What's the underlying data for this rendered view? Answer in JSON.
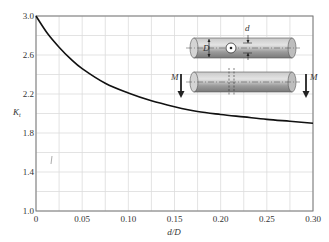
{
  "chart_data": {
    "type": "line",
    "title": "",
    "xlabel": "d/D",
    "ylabel": "Kt",
    "xlim": [
      0,
      0.3
    ],
    "ylim": [
      1.0,
      3.0
    ],
    "x_ticks": [
      "0",
      "0.05",
      "0.10",
      "0.15",
      "0.20",
      "0.25",
      "0.30"
    ],
    "y_ticks": [
      "1.0",
      "1.4",
      "1.8",
      "2.2",
      "2.6",
      "3.0"
    ],
    "grid": true,
    "minor_grid": {
      "x_step": 0.025,
      "y_step": 0.2
    },
    "legend": null,
    "series": [
      {
        "name": "Kt",
        "x": [
          0,
          0.0125,
          0.025,
          0.0375,
          0.05,
          0.075,
          0.1,
          0.125,
          0.15,
          0.175,
          0.2,
          0.225,
          0.25,
          0.275,
          0.3
        ],
        "values": [
          3.0,
          2.82,
          2.68,
          2.56,
          2.46,
          2.31,
          2.21,
          2.13,
          2.07,
          2.02,
          1.99,
          1.965,
          1.94,
          1.92,
          1.9
        ]
      }
    ],
    "annotations": [
      "D",
      "d",
      "M",
      "M"
    ],
    "inset": "shaft with transverse hole of diameter d, shaft diameter D, bending moments M"
  },
  "labels": {
    "xlabel": "d/D",
    "ylabel_main": "K",
    "ylabel_sub": "t",
    "inset_D": "D",
    "inset_d": "d",
    "inset_M_left": "M",
    "inset_M_right": "M"
  }
}
